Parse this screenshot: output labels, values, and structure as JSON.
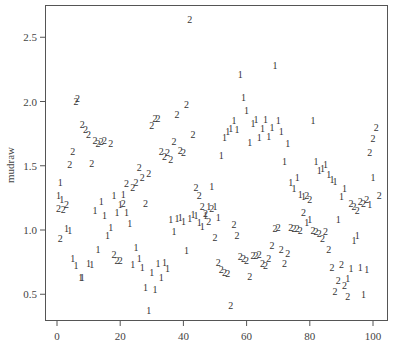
{
  "chart_data": {
    "type": "scatter",
    "title": "",
    "xlabel": "",
    "ylabel": "mudraw",
    "xlim": [
      -3,
      105
    ],
    "ylim": [
      0.28,
      2.74
    ],
    "xticks": [
      0,
      20,
      40,
      60,
      80,
      100
    ],
    "xtick_labels": [
      "0",
      "20",
      "40",
      "60",
      "80",
      "100"
    ],
    "yticks": [
      0.5,
      1.0,
      1.5,
      2.0,
      2.5
    ],
    "ytick_labels": [
      "0.5",
      "1.0",
      "1.5",
      "2.0",
      "2.5"
    ],
    "grid": false,
    "legend": null,
    "marker_style": "text labels '1' and '2' denote group",
    "series": [
      {
        "name": "1",
        "points": [
          [
            1,
            1.37
          ],
          [
            0.5,
            1.27
          ],
          [
            1.5,
            1.24
          ],
          [
            3,
            1.01
          ],
          [
            4,
            1.0
          ],
          [
            5,
            0.78
          ],
          [
            6,
            0.72
          ],
          [
            7.5,
            0.63
          ],
          [
            8,
            0.63
          ],
          [
            10,
            0.74
          ],
          [
            11,
            0.73
          ],
          [
            12,
            1.15
          ],
          [
            13,
            0.85
          ],
          [
            14,
            1.22
          ],
          [
            15,
            1.11
          ],
          [
            16,
            0.96
          ],
          [
            17,
            1.02
          ],
          [
            18,
            1.27
          ],
          [
            19,
            1.14
          ],
          [
            20,
            1.2
          ],
          [
            21,
            1.28
          ],
          [
            22,
            1.14
          ],
          [
            23,
            1.05
          ],
          [
            24,
            0.73
          ],
          [
            25,
            0.86
          ],
          [
            26,
            0.78
          ],
          [
            27,
            0.71
          ],
          [
            28,
            0.55
          ],
          [
            29,
            0.37
          ],
          [
            30,
            0.67
          ],
          [
            31,
            0.54
          ],
          [
            32,
            0.74
          ],
          [
            33,
            0.63
          ],
          [
            34,
            0.75
          ],
          [
            35,
            0.7
          ],
          [
            36,
            1.08
          ],
          [
            37,
            0.99
          ],
          [
            38,
            1.09
          ],
          [
            39,
            1.1
          ],
          [
            40,
            1.07
          ],
          [
            41,
            0.84
          ],
          [
            42,
            1.09
          ],
          [
            43,
            1.12
          ],
          [
            44,
            1.11
          ],
          [
            45,
            1.06
          ],
          [
            46,
            1.03
          ],
          [
            47,
            1.11
          ],
          [
            48,
            1.18
          ],
          [
            49,
            1.34
          ],
          [
            50,
            1.18
          ],
          [
            51,
            1.1
          ],
          [
            52,
            1.58
          ],
          [
            53,
            1.72
          ],
          [
            54,
            1.77
          ],
          [
            55,
            1.79
          ],
          [
            56,
            1.85
          ],
          [
            57,
            1.78
          ],
          [
            58,
            2.21
          ],
          [
            59,
            2.03
          ],
          [
            60,
            1.93
          ],
          [
            61,
            1.68
          ],
          [
            62,
            1.83
          ],
          [
            63,
            1.86
          ],
          [
            64,
            1.72
          ],
          [
            65,
            1.79
          ],
          [
            66,
            1.86
          ],
          [
            67,
            1.73
          ],
          [
            68,
            1.8
          ],
          [
            69,
            2.28
          ],
          [
            70,
            1.85
          ],
          [
            71,
            1.77
          ],
          [
            72,
            1.53
          ],
          [
            73,
            1.67
          ],
          [
            74,
            1.37
          ],
          [
            75,
            1.32
          ],
          [
            76,
            1.41
          ],
          [
            77,
            1.28
          ],
          [
            78,
            1.26
          ],
          [
            79,
            1.06
          ],
          [
            80,
            1.08
          ],
          [
            81,
            1.85
          ],
          [
            82,
            1.53
          ],
          [
            83,
            1.46
          ],
          [
            84,
            1.48
          ],
          [
            85,
            1.51
          ],
          [
            86,
            1.43
          ],
          [
            87,
            1.39
          ],
          [
            88,
            1.38
          ],
          [
            89,
            1.08
          ],
          [
            90,
            1.26
          ],
          [
            91,
            1.32
          ],
          [
            92,
            0.62
          ],
          [
            93,
            0.7
          ],
          [
            94,
            0.92
          ],
          [
            95,
            0.96
          ],
          [
            96,
            0.71
          ],
          [
            97,
            0.5
          ],
          [
            98,
            0.69
          ],
          [
            99,
            1.2
          ],
          [
            100,
            1.41
          ]
        ]
      },
      {
        "name": "2",
        "points": [
          [
            0.5,
            1.17
          ],
          [
            1,
            0.93
          ],
          [
            2,
            1.16
          ],
          [
            3,
            1.2
          ],
          [
            4,
            1.51
          ],
          [
            5,
            1.61
          ],
          [
            6,
            2.0
          ],
          [
            6.5,
            2.02
          ],
          [
            8,
            1.82
          ],
          [
            9,
            1.78
          ],
          [
            10,
            1.74
          ],
          [
            11,
            1.52
          ],
          [
            12,
            1.7
          ],
          [
            13,
            1.67
          ],
          [
            14,
            1.69
          ],
          [
            15,
            1.7
          ],
          [
            17,
            1.67
          ],
          [
            18,
            0.81
          ],
          [
            19,
            0.76
          ],
          [
            20,
            0.76
          ],
          [
            21,
            1.21
          ],
          [
            22,
            1.36
          ],
          [
            24,
            1.33
          ],
          [
            25,
            1.37
          ],
          [
            26,
            1.49
          ],
          [
            27,
            1.41
          ],
          [
            28,
            1.21
          ],
          [
            29,
            1.44
          ],
          [
            30,
            1.81
          ],
          [
            31,
            1.87
          ],
          [
            32,
            1.87
          ],
          [
            33,
            1.61
          ],
          [
            34,
            1.57
          ],
          [
            35,
            1.6
          ],
          [
            36,
            1.55
          ],
          [
            37,
            1.69
          ],
          [
            38,
            1.9
          ],
          [
            39,
            1.62
          ],
          [
            40,
            1.6
          ],
          [
            41,
            1.98
          ],
          [
            42,
            2.64
          ],
          [
            43,
            1.74
          ],
          [
            44,
            1.33
          ],
          [
            45,
            1.27
          ],
          [
            46,
            1.18
          ],
          [
            47,
            1.13
          ],
          [
            48,
            1.07
          ],
          [
            49,
            1.17
          ],
          [
            50,
            0.94
          ],
          [
            51,
            0.75
          ],
          [
            52,
            0.69
          ],
          [
            53,
            0.67
          ],
          [
            54,
            0.66
          ],
          [
            55,
            0.41
          ],
          [
            56,
            1.04
          ],
          [
            57,
            0.96
          ],
          [
            58,
            0.79
          ],
          [
            59,
            0.78
          ],
          [
            60,
            0.76
          ],
          [
            61,
            0.64
          ],
          [
            62,
            0.8
          ],
          [
            63,
            0.8
          ],
          [
            64,
            0.81
          ],
          [
            65,
            0.74
          ],
          [
            66,
            0.72
          ],
          [
            67,
            0.78
          ],
          [
            68,
            0.88
          ],
          [
            69,
            1.01
          ],
          [
            70,
            1.02
          ],
          [
            71,
            0.85
          ],
          [
            72,
            0.74
          ],
          [
            73,
            0.82
          ],
          [
            74,
            1.02
          ],
          [
            75,
            1.01
          ],
          [
            76,
            1.01
          ],
          [
            77,
            1.0
          ],
          [
            78,
            1.14
          ],
          [
            79,
            1.27
          ],
          [
            80,
            1.24
          ],
          [
            81,
            1.0
          ],
          [
            82,
            0.99
          ],
          [
            83,
            0.97
          ],
          [
            84,
            0.93
          ],
          [
            85,
            0.99
          ],
          [
            86,
            0.85
          ],
          [
            87,
            0.71
          ],
          [
            88,
            0.52
          ],
          [
            89,
            0.61
          ],
          [
            90,
            0.73
          ],
          [
            91,
            0.57
          ],
          [
            92,
            0.48
          ],
          [
            93,
            1.21
          ],
          [
            94,
            1.18
          ],
          [
            95,
            1.15
          ],
          [
            96,
            1.22
          ],
          [
            97,
            1.21
          ],
          [
            98,
            1.24
          ],
          [
            99,
            1.6
          ],
          [
            100,
            1.71
          ],
          [
            101,
            1.8
          ],
          [
            102,
            1.27
          ]
        ]
      }
    ]
  }
}
